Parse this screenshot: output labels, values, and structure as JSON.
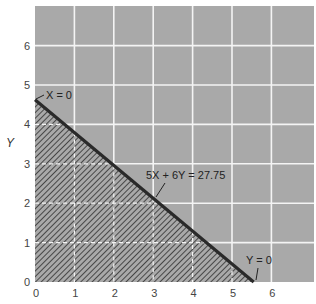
{
  "chart_data": {
    "type": "line",
    "title": "",
    "xlabel": "",
    "ylabel": "Y",
    "xlim": [
      0,
      6.5
    ],
    "ylim": [
      0,
      6.9
    ],
    "xticks": [
      0,
      1,
      2,
      3,
      4,
      5,
      6
    ],
    "yticks": [
      0,
      1,
      2,
      3,
      4,
      5,
      6
    ],
    "grid": true,
    "colors": {
      "background": "#a9a9a9",
      "grid": "#f2f2f2",
      "line": "#2a2a2a",
      "hatch": "#3c3c3c"
    },
    "series": [
      {
        "name": "5X + 6Y = 27.75",
        "points": [
          [
            0,
            4.625
          ],
          [
            5.55,
            0
          ]
        ]
      }
    ],
    "feasible_region": {
      "label": "shaded (hatched) region",
      "polygon": [
        [
          0,
          0
        ],
        [
          0,
          4.625
        ],
        [
          5.55,
          0
        ]
      ]
    },
    "annotations": [
      {
        "text": "X = 0",
        "x": 0.2,
        "y": 4.75,
        "points_to": [
          0,
          4.625
        ]
      },
      {
        "text": "5X + 6Y = 27.75",
        "x": 2.5,
        "y": 2.7,
        "points_to": [
          2.85,
          2.25
        ]
      },
      {
        "text": "Y = 0",
        "x": 5.4,
        "y": 0.5,
        "points_to": [
          5.6,
          0.05
        ]
      }
    ]
  },
  "labels": {
    "y_axis": "Y",
    "x_ticks": [
      "0",
      "1",
      "2",
      "3",
      "4",
      "5",
      "6"
    ],
    "y_ticks": [
      "0",
      "1",
      "2",
      "3",
      "4",
      "5",
      "6"
    ],
    "ann_x0": "X = 0",
    "ann_line": "5X + 6Y = 27.75",
    "ann_y0": "Y = 0"
  }
}
